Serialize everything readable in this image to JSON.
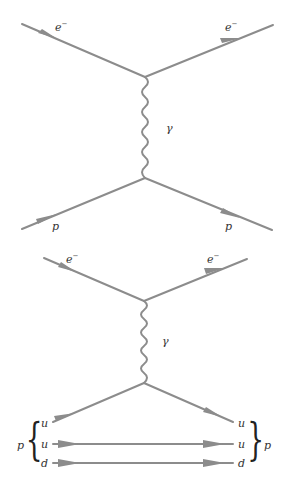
{
  "figure": {
    "colors": {
      "line": "#8c8c8c",
      "text": "#333333",
      "background": "#ffffff"
    },
    "diagram1": {
      "name": "electron-proton scattering",
      "incoming_top": {
        "label": "e",
        "superscript": "−"
      },
      "outgoing_top": {
        "label": "e",
        "superscript": "−"
      },
      "propagator": {
        "label": "γ"
      },
      "incoming_bottom": {
        "label": "p"
      },
      "outgoing_bottom": {
        "label": "p"
      }
    },
    "diagram2": {
      "name": "electron-quark scattering",
      "incoming_top": {
        "label": "e",
        "superscript": "−"
      },
      "outgoing_top": {
        "label": "e",
        "superscript": "−"
      },
      "propagator": {
        "label": "γ"
      },
      "proton_left": {
        "label": "p"
      },
      "proton_right": {
        "label": "p"
      },
      "quarks_left": [
        {
          "label": "u"
        },
        {
          "label": "u"
        },
        {
          "label": "d"
        }
      ],
      "quarks_right": [
        {
          "label": "u"
        },
        {
          "label": "u"
        },
        {
          "label": "d"
        }
      ]
    }
  }
}
